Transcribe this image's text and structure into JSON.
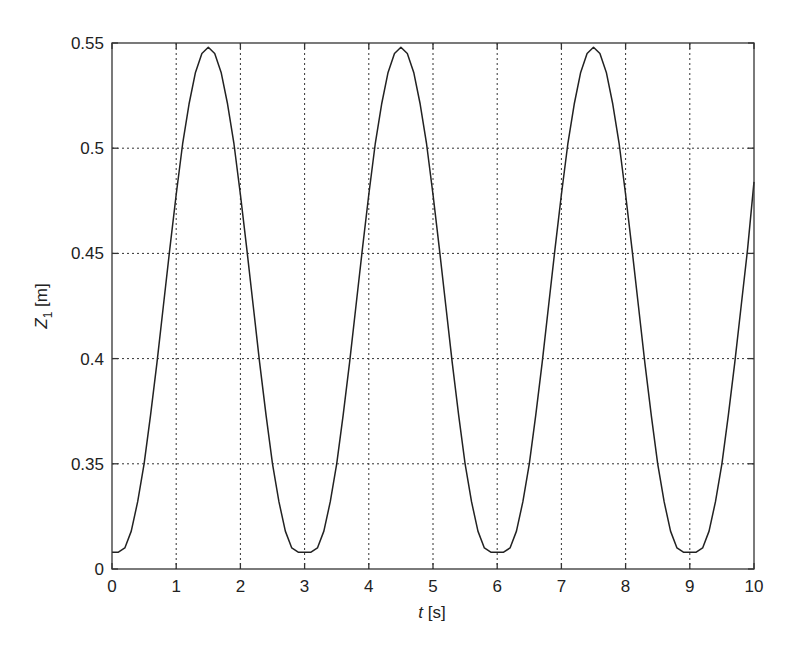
{
  "chart_data": {
    "type": "line",
    "title": "",
    "xlabel": {
      "var": "t",
      "unit": " [s]"
    },
    "ylabel": {
      "var": "Z",
      "sub": "1",
      "unit": " [m]"
    },
    "xlim": [
      0,
      10
    ],
    "ylim": [
      0.3,
      0.55
    ],
    "grid": true,
    "legend": "none",
    "x_ticks": [
      {
        "value": 0,
        "label": "0"
      },
      {
        "value": 1,
        "label": "1"
      },
      {
        "value": 2,
        "label": "2"
      },
      {
        "value": 3,
        "label": "3"
      },
      {
        "value": 4,
        "label": "4"
      },
      {
        "value": 5,
        "label": "5"
      },
      {
        "value": 6,
        "label": "6"
      },
      {
        "value": 7,
        "label": "7"
      },
      {
        "value": 8,
        "label": "8"
      },
      {
        "value": 9,
        "label": "9"
      },
      {
        "value": 10,
        "label": "10"
      }
    ],
    "y_ticks": [
      {
        "value": 0.3,
        "label": "0"
      },
      {
        "value": 0.35,
        "label": "0.35"
      },
      {
        "value": 0.4,
        "label": "0.4"
      },
      {
        "value": 0.45,
        "label": "0.45"
      },
      {
        "value": 0.5,
        "label": "0.5"
      },
      {
        "value": 0.55,
        "label": "0.55"
      }
    ],
    "series": [
      {
        "name": "Z1",
        "color": "#222222",
        "x": [
          0.0,
          0.1,
          0.2,
          0.3,
          0.4,
          0.5,
          0.6,
          0.7,
          0.8,
          0.9,
          1.0,
          1.1,
          1.2,
          1.3,
          1.4,
          1.5,
          1.6,
          1.7,
          1.8,
          1.9,
          2.0,
          2.1,
          2.2,
          2.3,
          2.4,
          2.5,
          2.6,
          2.7,
          2.8,
          2.9,
          3.0,
          3.1,
          3.2,
          3.3,
          3.4,
          3.5,
          3.6,
          3.7,
          3.8,
          3.9,
          4.0,
          4.1,
          4.2,
          4.3,
          4.4,
          4.5,
          4.6,
          4.7,
          4.8,
          4.9,
          5.0,
          5.1,
          5.2,
          5.3,
          5.4,
          5.5,
          5.6,
          5.7,
          5.8,
          5.9,
          6.0,
          6.1,
          6.2,
          6.3,
          6.4,
          6.5,
          6.6,
          6.7,
          6.8,
          6.9,
          7.0,
          7.1,
          7.2,
          7.3,
          7.4,
          7.5,
          7.6,
          7.7,
          7.8,
          7.9,
          8.0,
          8.1,
          8.2,
          8.3,
          8.4,
          8.5,
          8.6,
          8.7,
          8.8,
          8.9,
          9.0,
          9.1,
          9.2,
          9.3,
          9.4,
          9.5,
          9.6,
          9.7,
          9.8,
          9.9,
          10.0
        ],
        "y": [
          0.308,
          0.308,
          0.31,
          0.318,
          0.332,
          0.35,
          0.373,
          0.398,
          0.425,
          0.452,
          0.478,
          0.502,
          0.521,
          0.536,
          0.545,
          0.548,
          0.545,
          0.536,
          0.521,
          0.502,
          0.478,
          0.452,
          0.425,
          0.398,
          0.373,
          0.35,
          0.332,
          0.318,
          0.31,
          0.308,
          0.308,
          0.308,
          0.31,
          0.318,
          0.332,
          0.35,
          0.373,
          0.398,
          0.425,
          0.452,
          0.478,
          0.502,
          0.521,
          0.536,
          0.545,
          0.548,
          0.545,
          0.536,
          0.521,
          0.502,
          0.478,
          0.452,
          0.425,
          0.398,
          0.373,
          0.35,
          0.332,
          0.318,
          0.31,
          0.308,
          0.308,
          0.308,
          0.31,
          0.318,
          0.332,
          0.35,
          0.373,
          0.398,
          0.425,
          0.452,
          0.478,
          0.502,
          0.521,
          0.536,
          0.545,
          0.548,
          0.545,
          0.536,
          0.521,
          0.502,
          0.478,
          0.452,
          0.425,
          0.398,
          0.373,
          0.35,
          0.332,
          0.318,
          0.31,
          0.308,
          0.308,
          0.308,
          0.31,
          0.318,
          0.332,
          0.35,
          0.373,
          0.398,
          0.425,
          0.452,
          0.484
        ]
      }
    ]
  }
}
